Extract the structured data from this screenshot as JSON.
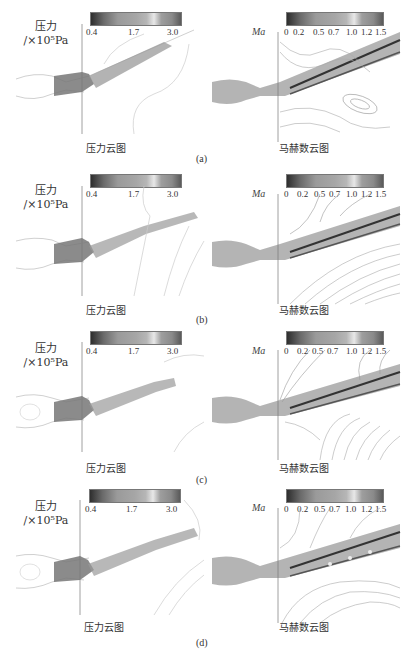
{
  "figure": {
    "panels": [
      {
        "label": "(a)",
        "pressure": {
          "quantity": "压力",
          "unit": "/×10⁵Pa",
          "colorbar_ticks": [
            "0.4",
            "1.7",
            "3.0"
          ],
          "caption": "压力云图"
        },
        "mach": {
          "quantity": "Ma",
          "colorbar_ticks": [
            "0",
            "0.2",
            "0.5",
            "0.7",
            "1.0",
            "1.2",
            "1.5"
          ],
          "caption": "马赫数云图"
        }
      },
      {
        "label": "(b)",
        "pressure": {
          "quantity": "压力",
          "unit": "/×10⁵Pa",
          "colorbar_ticks": [
            "0.4",
            "1.7",
            "3.0"
          ],
          "caption": "压力云图"
        },
        "mach": {
          "quantity": "Ma",
          "colorbar_ticks": [
            "0",
            "0.2",
            "0.5",
            "0.7",
            "1.0",
            "1.2",
            "1.5"
          ],
          "caption": "马赫数云图"
        }
      },
      {
        "label": "(c)",
        "pressure": {
          "quantity": "压力",
          "unit": "/×10⁵Pa",
          "colorbar_ticks": [
            "0.4",
            "1.7",
            "3.0"
          ],
          "caption": "压力云图"
        },
        "mach": {
          "quantity": "Ma",
          "colorbar_ticks": [
            "0",
            "0.2",
            "0.5",
            "0.7",
            "1.0",
            "1.2",
            "1.5"
          ],
          "caption": "马赫数云图"
        }
      },
      {
        "label": "(d)",
        "pressure": {
          "quantity": "压力",
          "unit": "/×10⁵Pa",
          "colorbar_ticks": [
            "0.4",
            "1.7",
            "3.0"
          ],
          "caption": "压力云图"
        },
        "mach": {
          "quantity": "Ma",
          "colorbar_ticks": [
            "0",
            "0.2",
            "0.5",
            "0.7",
            "1.0",
            "1.2",
            "1.5"
          ],
          "caption": "马赫数云图"
        }
      }
    ],
    "colors": {
      "background": "#ffffff",
      "contour_line": "#9a9a9a",
      "jet_dark": "#555555",
      "text": "#333333"
    }
  }
}
